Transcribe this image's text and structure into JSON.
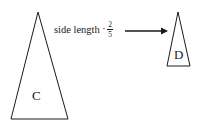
{
  "diagram": {
    "background_color": "#ffffff",
    "stroke_color": "#1a1a1a",
    "operation": {
      "text": "side length",
      "operator_symbol": "·",
      "factor_numerator": "2",
      "factor_denominator": "5",
      "factor_plain": "2/5"
    },
    "arrow": {
      "name": "rightwards-arrow",
      "direction": "right",
      "from_x": 125,
      "to_x": 168,
      "y": 31
    },
    "shapes": [
      {
        "id": "triangle-c",
        "label": "C",
        "type": "isosceles-triangle",
        "apex_x": 38,
        "apex_y": 12,
        "base_left_x": 11,
        "base_right_x": 68,
        "base_y": 119,
        "base_width": 57,
        "height": 107
      },
      {
        "id": "triangle-d",
        "label": "D",
        "type": "isosceles-triangle",
        "apex_x": 178,
        "apex_y": 12,
        "base_left_x": 167,
        "base_right_x": 190,
        "base_y": 66,
        "base_width": 23,
        "height": 54
      }
    ]
  }
}
